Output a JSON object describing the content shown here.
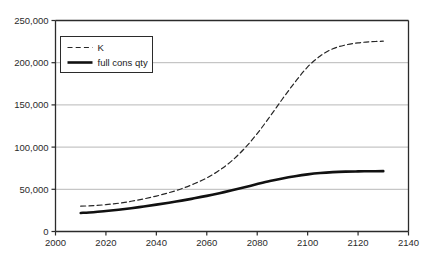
{
  "chart_data": {
    "type": "line",
    "title": "",
    "subtitle": "",
    "xlabel": "",
    "ylabel": "",
    "xlim": [
      2000,
      2140
    ],
    "ylim": [
      0,
      250000
    ],
    "x_ticks": [
      2000,
      2020,
      2040,
      2060,
      2080,
      2100,
      2120,
      2140
    ],
    "x_tick_labels": [
      "2000",
      "2020",
      "2040",
      "2060",
      "2080",
      "2100",
      "2120",
      "2140"
    ],
    "y_ticks": [
      0,
      50000,
      100000,
      150000,
      200000,
      250000
    ],
    "y_tick_labels": [
      "0",
      "50,000",
      "100,000",
      "150,000",
      "200,000",
      "250,000"
    ],
    "grid": "horizontal",
    "grid_color": "#b8b8b8",
    "axis_color": "#2b2b2b",
    "plot_background": "#ffffff",
    "legend_position": "upper left inside plot",
    "x": [
      2010,
      2015,
      2020,
      2025,
      2030,
      2035,
      2040,
      2045,
      2050,
      2055,
      2060,
      2065,
      2070,
      2075,
      2080,
      2085,
      2090,
      2095,
      2100,
      2105,
      2110,
      2115,
      2120,
      2125,
      2130
    ],
    "series": [
      {
        "name": "K",
        "style": "dashed",
        "color": "#262626",
        "width": 1.2,
        "values": [
          30000,
          30600,
          31800,
          33500,
          35800,
          38600,
          42000,
          46000,
          50700,
          56500,
          63500,
          72500,
          84000,
          98500,
          116000,
          136000,
          157000,
          177000,
          195000,
          208000,
          216500,
          221000,
          223500,
          224800,
          225500
        ]
      },
      {
        "name": "full cons qty",
        "style": "solid",
        "color": "#111111",
        "width": 2.6,
        "values": [
          22000,
          22800,
          24200,
          25800,
          27600,
          29600,
          31800,
          34100,
          36600,
          39300,
          42200,
          45400,
          48800,
          52400,
          56200,
          59800,
          62900,
          65500,
          67700,
          69300,
          70300,
          70900,
          71200,
          71400,
          71500
        ]
      }
    ],
    "legend": [
      {
        "label": "K",
        "style": "dashed"
      },
      {
        "label": "full cons qty",
        "style": "solid"
      }
    ]
  }
}
